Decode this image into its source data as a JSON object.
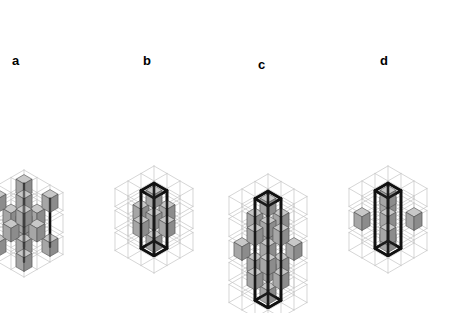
{
  "figure": {
    "background": "#ffffff",
    "width": 473,
    "height": 313,
    "kind": "isometric-crystal-structure-diagram",
    "panel_count": 4
  },
  "style": {
    "cube_top_fill": "#c8c8c8",
    "cube_left_fill": "#a6a6a6",
    "cube_right_fill": "#8c8c8c",
    "cube_edge": "#4d4d4d",
    "lattice_line": "#c4c4c4",
    "unitcell_line": "#111111",
    "unitcell_width": 2.6,
    "lattice_width": 0.7,
    "cube_edge_width": 0.6
  },
  "projection": {
    "cell": 22,
    "iso_dx": 13,
    "iso_dy": 7.5,
    "cube_scale": 0.62
  },
  "panels": [
    {
      "id": "a",
      "label": "a",
      "label_x": 12,
      "label_y": 54,
      "origin_x": 24,
      "origin_y": 232,
      "layers": 3,
      "grid": 3,
      "show_lattice": true,
      "show_unitcell_frame": false,
      "show_rods": true,
      "occupancy": [
        [
          [
            1,
            0,
            1
          ],
          [
            0,
            1,
            0
          ],
          [
            1,
            0,
            1
          ]
        ],
        [
          [
            0,
            1,
            0
          ],
          [
            1,
            1,
            1
          ],
          [
            0,
            1,
            0
          ]
        ],
        [
          [
            1,
            0,
            1
          ],
          [
            0,
            1,
            0
          ],
          [
            1,
            0,
            1
          ]
        ]
      ]
    },
    {
      "id": "b",
      "label": "b",
      "label_x": 143,
      "label_y": 54,
      "origin_x": 154,
      "origin_y": 228,
      "layers": 3,
      "grid": 3,
      "show_lattice": true,
      "show_unitcell_frame": true,
      "show_rods": false,
      "occupancy": [
        [
          [
            0,
            0,
            0
          ],
          [
            0,
            1,
            0
          ],
          [
            0,
            0,
            0
          ]
        ],
        [
          [
            0,
            1,
            0
          ],
          [
            1,
            1,
            1
          ],
          [
            0,
            1,
            0
          ]
        ],
        [
          [
            0,
            0,
            0
          ],
          [
            0,
            1,
            0
          ],
          [
            0,
            0,
            0
          ]
        ]
      ]
    },
    {
      "id": "c",
      "label": "c",
      "label_x": 258,
      "label_y": 58,
      "origin_x": 268,
      "origin_y": 280,
      "layers": 5,
      "grid": 3,
      "show_lattice": true,
      "show_unitcell_frame": true,
      "show_rods": false,
      "occupancy": [
        [
          [
            0,
            0,
            0
          ],
          [
            0,
            1,
            0
          ],
          [
            0,
            0,
            0
          ]
        ],
        [
          [
            0,
            1,
            0
          ],
          [
            1,
            1,
            1
          ],
          [
            0,
            1,
            0
          ]
        ],
        [
          [
            1,
            0,
            1
          ],
          [
            0,
            1,
            0
          ],
          [
            1,
            0,
            1
          ]
        ],
        [
          [
            0,
            1,
            0
          ],
          [
            1,
            1,
            1
          ],
          [
            0,
            1,
            0
          ]
        ],
        [
          [
            0,
            0,
            0
          ],
          [
            0,
            1,
            0
          ],
          [
            0,
            0,
            0
          ]
        ]
      ]
    },
    {
      "id": "d",
      "label": "d",
      "label_x": 380,
      "label_y": 54,
      "origin_x": 388,
      "origin_y": 228,
      "layers": 3,
      "grid": 3,
      "show_lattice": true,
      "show_unitcell_frame": true,
      "show_rods": false,
      "occupancy": [
        [
          [
            0,
            0,
            0
          ],
          [
            0,
            1,
            0
          ],
          [
            0,
            0,
            0
          ]
        ],
        [
          [
            1,
            0,
            1
          ],
          [
            0,
            1,
            0
          ],
          [
            1,
            0,
            1
          ]
        ],
        [
          [
            0,
            0,
            0
          ],
          [
            0,
            1,
            0
          ],
          [
            0,
            0,
            0
          ]
        ]
      ]
    }
  ]
}
